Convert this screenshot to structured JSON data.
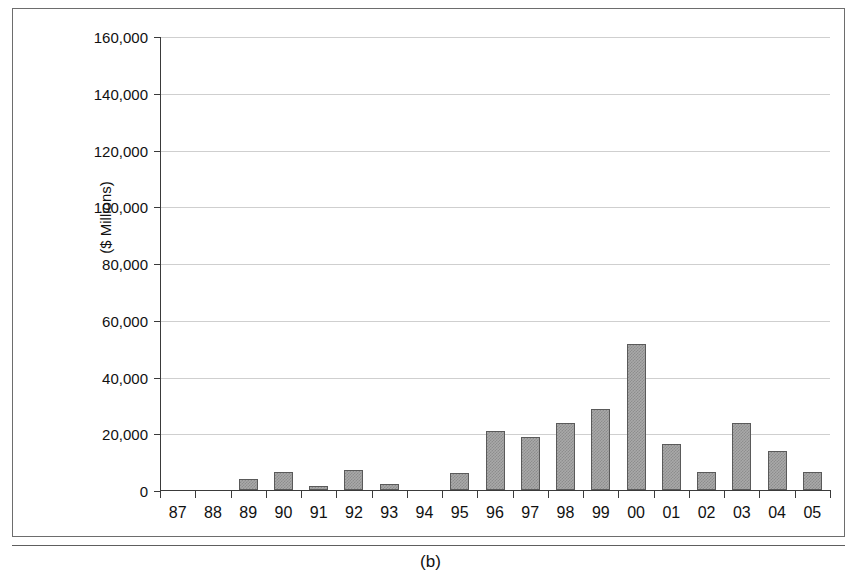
{
  "figure": {
    "caption": "(b)"
  },
  "chart_data": {
    "type": "bar",
    "title": "",
    "xlabel": "",
    "ylabel": "($ Millions)",
    "ylim": [
      0,
      160000
    ],
    "ytick_step": 20000,
    "ytick_labels": [
      "0",
      "20,000",
      "40,000",
      "60,000",
      "80,000",
      "100,000",
      "120,000",
      "140,000",
      "160,000"
    ],
    "ytick_values": [
      0,
      20000,
      40000,
      60000,
      80000,
      100000,
      120000,
      140000,
      160000
    ],
    "grid": true,
    "legend": "none",
    "categories": [
      "87",
      "88",
      "89",
      "90",
      "91",
      "92",
      "93",
      "94",
      "95",
      "96",
      "97",
      "98",
      "99",
      "00",
      "01",
      "02",
      "03",
      "04",
      "05"
    ],
    "values": [
      0,
      0,
      3900,
      6200,
      1400,
      7200,
      2100,
      0,
      6100,
      20800,
      18800,
      23600,
      28700,
      51600,
      16200,
      6500,
      23500,
      13800,
      6400
    ],
    "bar_color": "#a9a9a9",
    "bar_edge_color": "#5a5a5a",
    "gridline_color": "#cfcfcf",
    "axis_color": "#3a3a3a"
  }
}
